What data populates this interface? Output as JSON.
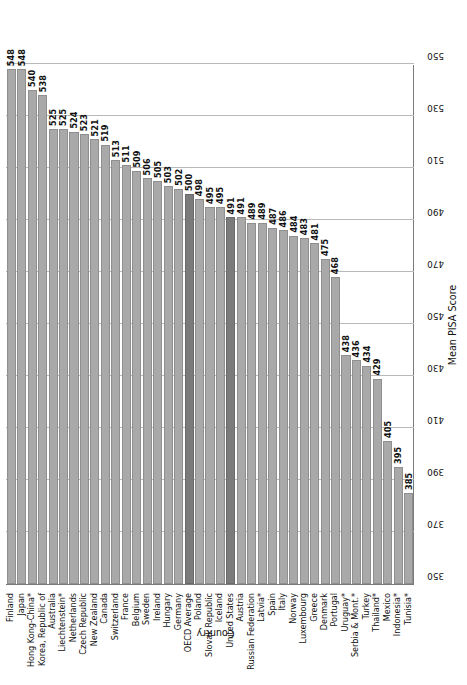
{
  "chart_data": {
    "type": "bar",
    "orientation": "horizontal",
    "title": "",
    "xlabel": "Mean PISA Score",
    "ylabel": "Country",
    "xlim": [
      350,
      550
    ],
    "xticks": [
      550,
      530,
      510,
      490,
      470,
      450,
      430,
      410,
      390,
      370,
      350
    ],
    "grid": true,
    "legend": null,
    "highlight_color": "#7b7b7b",
    "bar_color": "#a9a9a9",
    "categories": [
      "Finland",
      "Japan",
      "Hong Kong-China*",
      "Korea, Republic of",
      "Australia",
      "Liechtenstein*",
      "Netherlands",
      "Czech Republic",
      "New Zealand",
      "Canada",
      "Switzerland",
      "France",
      "Belgium",
      "Sweden",
      "Ireland",
      "Hungary",
      "Germany",
      "OECD Average",
      "Poland",
      "Slovak Republic",
      "Iceland",
      "United States",
      "Austria",
      "Russian Federation",
      "Latvia*",
      "Spain",
      "Italy",
      "Norway",
      "Luxembourg",
      "Greece",
      "Denmark",
      "Portugal",
      "Uruguay*",
      "Serbia & Mont.*",
      "Turkey",
      "Thailand*",
      "Mexico",
      "Indonesia*",
      "Tunisia*"
    ],
    "values": [
      548,
      548,
      540,
      538,
      525,
      525,
      524,
      523,
      521,
      519,
      513,
      511,
      509,
      506,
      505,
      503,
      502,
      500,
      498,
      495,
      495,
      491,
      491,
      489,
      489,
      487,
      486,
      484,
      483,
      481,
      475,
      468,
      438,
      436,
      434,
      429,
      405,
      395,
      385
    ],
    "highlighted": [
      "OECD Average",
      "United States"
    ]
  }
}
